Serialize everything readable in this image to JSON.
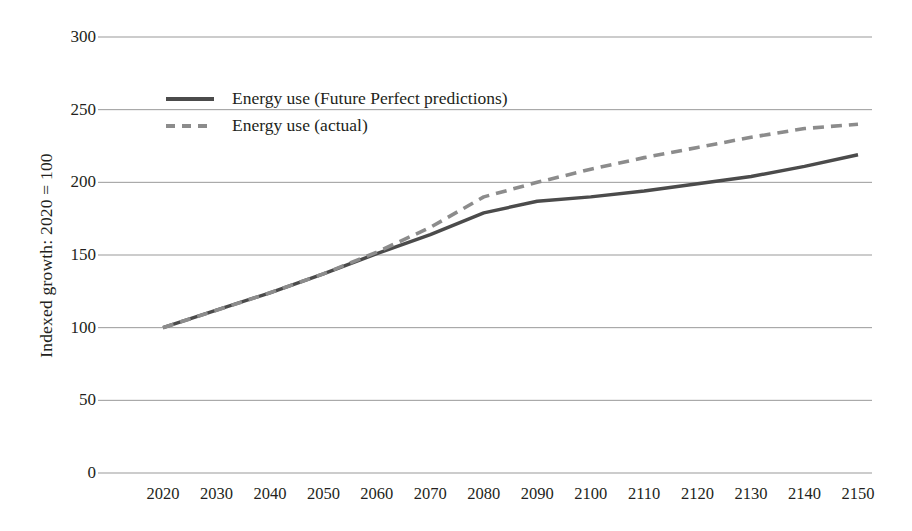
{
  "chart_data": {
    "type": "line",
    "title": "",
    "xlabel": "",
    "ylabel": "Indexed growth: 2020 = 100",
    "x": [
      2020,
      2030,
      2040,
      2050,
      2060,
      2070,
      2080,
      2090,
      2100,
      2110,
      2120,
      2130,
      2140,
      2150
    ],
    "xticklabels": [
      "2020",
      "2030",
      "2040",
      "2050",
      "2060",
      "2070",
      "2080",
      "2090",
      "2100",
      "2110",
      "2120",
      "2130",
      "2140",
      "2150"
    ],
    "yticks": [
      0,
      50,
      100,
      150,
      200,
      250,
      300
    ],
    "yticklabels": [
      "0",
      "50",
      "100",
      "150",
      "200",
      "250",
      "300"
    ],
    "ylim": [
      0,
      300
    ],
    "xlim": [
      2020,
      2150
    ],
    "grid": true,
    "grid_axis": "y",
    "legend_position": "upper-left-inside",
    "series": [
      {
        "name": "Energy use (Future Perfect predictions)",
        "style": "solid",
        "color": "#4b4b4b",
        "values": [
          100,
          112,
          124,
          137,
          151,
          164,
          179,
          187,
          190,
          194,
          199,
          204,
          211,
          219
        ]
      },
      {
        "name": "Energy use (actual)",
        "style": "dashed",
        "color": "#8c8c8c",
        "values": [
          100,
          112,
          124,
          137,
          152,
          169,
          190,
          200,
          209,
          217,
          224,
          231,
          237,
          240
        ]
      }
    ]
  }
}
